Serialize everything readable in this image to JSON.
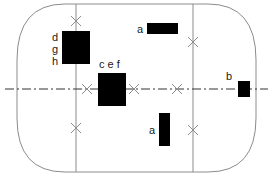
{
  "diagram": {
    "colors": {
      "outline": "#8c8c8c",
      "centerline": "#333333",
      "block": "#000000",
      "marker": "#8c8c8c",
      "label": "#1a1a1a"
    },
    "outline": {
      "x": 17,
      "y": 4,
      "width": 239,
      "height": 168,
      "corner_radius": 48
    },
    "vertical_lines": [
      {
        "name": "left-divider",
        "x": 76
      },
      {
        "name": "right-divider",
        "x": 193
      }
    ],
    "centerline": {
      "y": 89,
      "x1": 5,
      "x2": 268,
      "style": "dash-dot"
    },
    "markers": [
      {
        "x": 76,
        "y": 21
      },
      {
        "x": 76,
        "y": 128
      },
      {
        "x": 87,
        "y": 89
      },
      {
        "x": 134,
        "y": 89
      },
      {
        "x": 177,
        "y": 89
      },
      {
        "x": 193,
        "y": 42
      },
      {
        "x": 193,
        "y": 130
      }
    ],
    "blocks": [
      {
        "id": "dgh",
        "x": 62,
        "y": 31,
        "w": 28,
        "h": 33
      },
      {
        "id": "cef",
        "x": 98,
        "y": 73,
        "w": 28,
        "h": 33
      },
      {
        "id": "a-top",
        "x": 147,
        "y": 23,
        "w": 31,
        "h": 11
      },
      {
        "id": "a-bottom",
        "x": 159,
        "y": 113,
        "w": 11,
        "h": 33
      },
      {
        "id": "b",
        "x": 238,
        "y": 81,
        "w": 12,
        "h": 16
      }
    ],
    "labels": {
      "dgh_d": "d",
      "dgh_g": "g",
      "dgh_h": "h",
      "cef": "c e f",
      "a_top": "a",
      "a_bottom": "a",
      "b": "b"
    }
  }
}
